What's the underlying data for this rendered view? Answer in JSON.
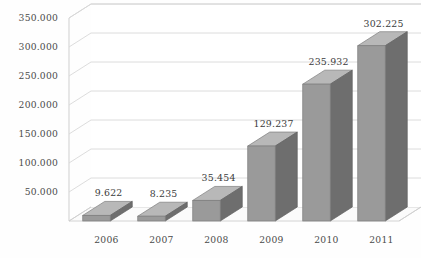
{
  "chart_data": {
    "type": "bar",
    "title": "",
    "subtitle": "",
    "xlabel": "",
    "ylabel": "",
    "categories": [
      "2006",
      "2007",
      "2008",
      "2009",
      "2010",
      "2011"
    ],
    "values": [
      9622,
      8235,
      35454,
      129237,
      235932,
      302225
    ],
    "value_labels": [
      "9.622",
      "8.235",
      "35.454",
      "129.237",
      "235.932",
      "302.225"
    ],
    "ytick_labels": [
      "50.000",
      "100.000",
      "150.000",
      "200.000",
      "250.000",
      "300.000",
      "350.000"
    ],
    "ytick_values": [
      50000,
      100000,
      150000,
      200000,
      250000,
      300000,
      350000
    ],
    "ylim": [
      0,
      350000
    ],
    "grid": true,
    "legend": false,
    "legend_position": "none",
    "style": "3d-column",
    "colors": {
      "bar_front": "#9a9a9a",
      "bar_side": "#6e6e6e",
      "bar_top": "#b8b8b8",
      "grid": "#d8d8d8",
      "wall": "#cfcfcf",
      "floor": "#fbfbfb",
      "text": "#4a4a4a",
      "background": "#fefefe"
    }
  }
}
